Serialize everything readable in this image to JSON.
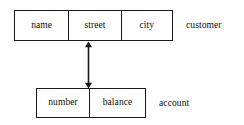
{
  "diagram": {
    "type": "entity-relationship-diagram",
    "background_color": "#ffffff",
    "line_color": "#1a1a1a",
    "text_color": "#0d0d0d",
    "entities": [
      {
        "id": "customer",
        "label": "customer",
        "attributes": [
          {
            "label": "name"
          },
          {
            "label": "street"
          },
          {
            "label": "city"
          }
        ]
      },
      {
        "id": "account",
        "label": "account",
        "attributes": [
          {
            "label": "number"
          },
          {
            "label": "balance"
          }
        ]
      }
    ],
    "connector": {
      "name": "double-headed-arrow",
      "from": "customer",
      "to": "account",
      "style": "double-arrow-vertical"
    }
  }
}
